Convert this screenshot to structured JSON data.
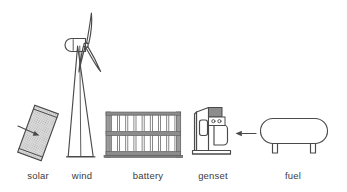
{
  "diagram": {
    "background_color": "#ffffff",
    "stroke_color": "#4a4a4a",
    "label_color": "#3b3b3b",
    "components": [
      {
        "id": "solar",
        "label": "solar",
        "icon": "solar-panel-icon",
        "label_x": 38,
        "label_y": 179,
        "fill_color": "#d0d0d0",
        "description": "tilted photovoltaic panel with incoming irradiance arrow"
      },
      {
        "id": "wind",
        "label": "wind",
        "icon": "wind-turbine-icon",
        "label_x": 82,
        "label_y": 179,
        "fill_color": "#ffffff",
        "blade_count": 3,
        "description": "three bladed wind turbine on tapered lattice tower"
      },
      {
        "id": "battery",
        "label": "battery",
        "icon": "battery-rack-icon",
        "label_x": 148,
        "label_y": 179,
        "fill_color": "#8c8c8c",
        "shelves": 2,
        "cells_per_shelf": 8,
        "description": "two shelf battery rack with cells"
      },
      {
        "id": "genset",
        "label": "genset",
        "icon": "generator-set-icon",
        "label_x": 213,
        "label_y": 179,
        "fill_color": "#8c8c8c",
        "description": "diesel generator set with control panel and engine"
      },
      {
        "id": "fuel",
        "label": "fuel",
        "icon": "fuel-tank-icon",
        "label_x": 293,
        "label_y": 179,
        "fill_color": "#ffffff",
        "legs": 2,
        "description": "horizontal cylindrical fuel storage tank on legs"
      }
    ],
    "connectors": [
      {
        "id": "fuel-to-genset",
        "from": "fuel",
        "to": "genset",
        "direction": "left",
        "style": "solid-arrow"
      },
      {
        "id": "irradiance-to-solar",
        "from": "sun",
        "to": "solar",
        "direction": "upper-right",
        "style": "solid-arrow"
      }
    ]
  }
}
